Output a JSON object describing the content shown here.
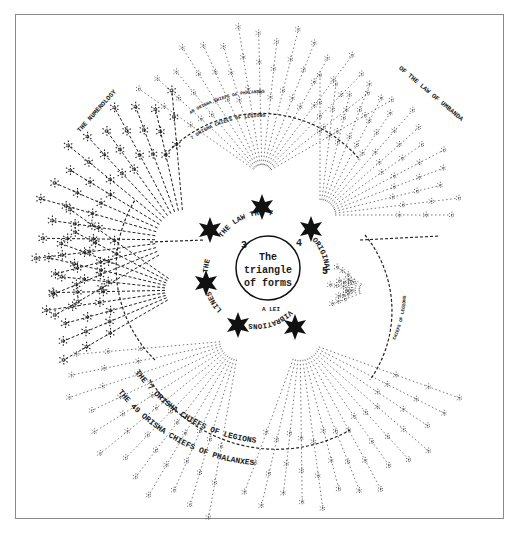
{
  "diagram": {
    "title_left": "THE NUMEROLOGY",
    "title_right": "OF THE LAW OF UMBANDA",
    "center": {
      "line1": "The",
      "line2": "triangle",
      "line3": "of forms",
      "ring_labels": [
        "3",
        "4",
        "5",
        "A LEI"
      ]
    },
    "inner_ring": {
      "top": "THE LAW THE 7",
      "left": "LINES OF THE",
      "right": "ORIGINAL",
      "bottom": "VIBRATIONS OR"
    },
    "arcs": {
      "lower_legions": "THE 7 ORISHA CHIEFS OF LEGIONS",
      "lower_phalanxes": "THE 49 ORISHA CHIEFS OF PHALANXES",
      "upper_legions": "7 ORISHA CHIEFS OF LEGIONS",
      "upper_phalanxes": "49 ORISHA CHIEFS OF PHALANXES",
      "right_legions": "CHIEFS OF LEGIONS"
    },
    "stars": [
      {
        "name": "top",
        "x": 262,
        "y": 207
      },
      {
        "name": "upper-left",
        "x": 210,
        "y": 230
      },
      {
        "name": "upper-right",
        "x": 311,
        "y": 229
      },
      {
        "name": "left",
        "x": 206,
        "y": 283
      },
      {
        "name": "lower-left",
        "x": 238,
        "y": 325
      },
      {
        "name": "lower-right",
        "x": 295,
        "y": 327
      }
    ],
    "colors": {
      "ink": "#1a1a1a",
      "frame": "#8a8a8a",
      "paper": "#ffffff"
    }
  }
}
